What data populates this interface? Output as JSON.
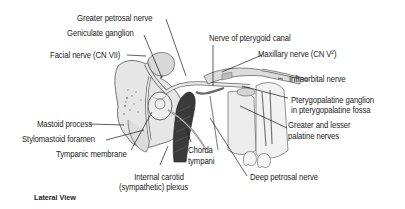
{
  "figure": {
    "caption": "Lateral View",
    "labels": {
      "greater_petrosal_nerve": "Greater petrosal nerve",
      "geniculate_ganglion": "Geniculate ganglion",
      "facial_nerve": "Facial nerve (CN VII)",
      "nerve_of_pterygoid_canal": "Nerve of pterygoid canal",
      "maxillary_nerve": "Maxillary nerve (CN V",
      "maxillary_nerve_sup": "2",
      "maxillary_nerve_close": ")",
      "infraorbital_nerve": "Infraorbital nerve",
      "pterygopalatine_ganglion_1": "Pterygopalatine ganglion",
      "pterygopalatine_ganglion_2": "in pterygopalatine fossa",
      "greater_lesser_palatine_1": "Greater and lesser",
      "greater_lesser_palatine_2": "palatine nerves",
      "mastoid_process": "Mastoid process",
      "stylomastoid_foramen": "Stylomastoid foramen",
      "tympanic_membrane": "Tympanic membrane",
      "chorda_tympani_1": "Chorda",
      "chorda_tympani_2": "tympani",
      "internal_carotid_1": "Internal carotid",
      "internal_carotid_2": "(sympathetic) plexus",
      "deep_petrosal_nerve": "Deep petrosal nerve"
    }
  }
}
